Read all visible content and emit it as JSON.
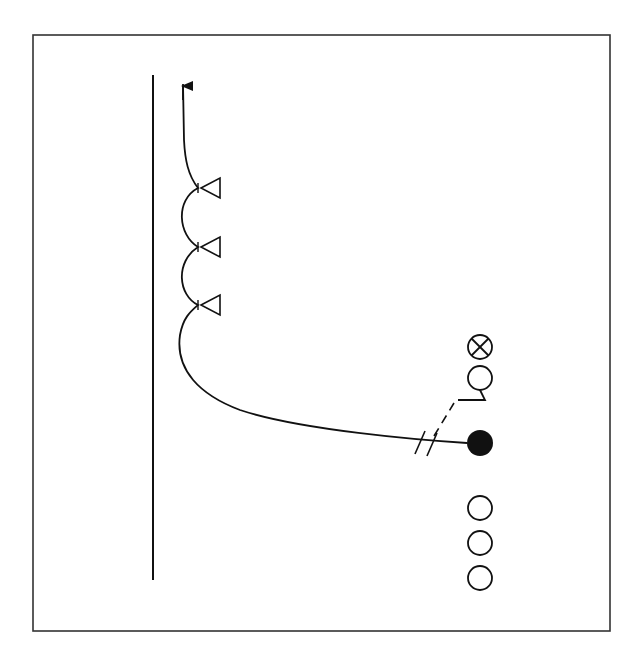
{
  "diagram": {
    "type": "play-diagram",
    "frame": {
      "x": 33,
      "y": 35,
      "width": 577,
      "height": 596,
      "stroke": "#333333"
    },
    "sideline": {
      "x": 153,
      "y1": 75,
      "y2": 580
    },
    "players": [
      {
        "id": "receiver-x",
        "symbol": "circle-x",
        "cx": 480,
        "cy": 347
      },
      {
        "id": "player-with-flag-route",
        "symbol": "circle",
        "cx": 480,
        "cy": 379
      },
      {
        "id": "ball-carrier",
        "symbol": "filled-circle",
        "cx": 480,
        "cy": 443
      },
      {
        "id": "player-1",
        "symbol": "circle",
        "cx": 480,
        "cy": 508
      },
      {
        "id": "player-2",
        "symbol": "circle",
        "cx": 480,
        "cy": 543
      },
      {
        "id": "player-3",
        "symbol": "circle",
        "cx": 480,
        "cy": 578
      }
    ],
    "cones": [
      {
        "id": "cone-1",
        "x": 200,
        "y": 188
      },
      {
        "id": "cone-2",
        "x": 200,
        "y": 247
      },
      {
        "id": "cone-3",
        "x": 200,
        "y": 305
      }
    ],
    "ink_color": "#111111"
  }
}
